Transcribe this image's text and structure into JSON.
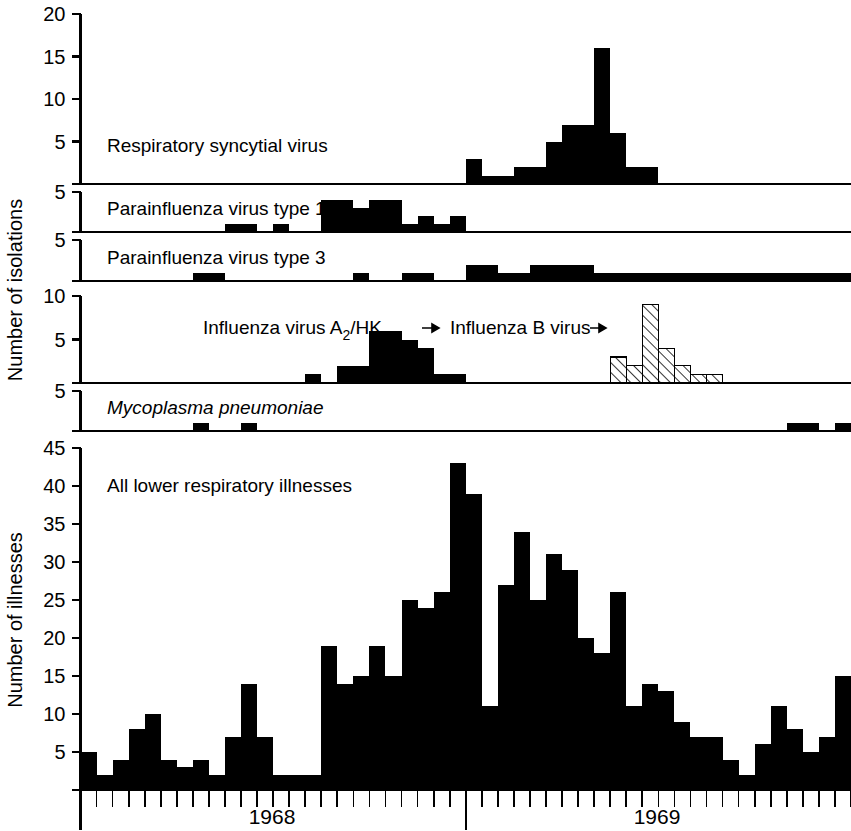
{
  "figure": {
    "axis_titles": {
      "isolations": "Number of isolations",
      "illnesses": "Number of illnesses"
    },
    "x_axis": {
      "year_labels": [
        "1968",
        "1969"
      ],
      "tick_count": 48,
      "major_tick_index": 24
    },
    "panels": [
      {
        "id": "rsv",
        "label": "Respiratory syncytial virus",
        "ymax": 20,
        "yticks": [
          5,
          10,
          15,
          20
        ]
      },
      {
        "id": "para1",
        "label": "Parainfluenza virus type 1",
        "ymax": 5,
        "yticks": [
          5
        ]
      },
      {
        "id": "para3",
        "label": "Parainfluenza virus type 3",
        "ymax": 5,
        "yticks": [
          5
        ]
      },
      {
        "id": "influenza",
        "label_a": "Influenza virus A",
        "label_a_sub": "2",
        "label_a_tail": "/HK",
        "label_b": "Influenza B virus",
        "ymax": 10,
        "yticks": [
          5,
          10
        ]
      },
      {
        "id": "mycoplasma",
        "label": "Mycoplasma pneumoniae",
        "ymax": 5,
        "yticks": [
          5
        ]
      },
      {
        "id": "illness",
        "label": "All lower respiratory illnesses",
        "ymax": 45,
        "yticks": [
          5,
          10,
          15,
          20,
          25,
          30,
          35,
          40,
          45
        ]
      }
    ],
    "colors": {
      "ink": "#000000",
      "background": "#ffffff",
      "hatch": "#000000"
    }
  },
  "chart_data": [
    {
      "type": "bar",
      "id": "rsv",
      "title": "Respiratory syncytial virus",
      "xlabel": "",
      "ylabel": "Number of isolations",
      "ylim": [
        0,
        20
      ],
      "grid": false,
      "categories": [
        1,
        2,
        3,
        4,
        5,
        6,
        7,
        8,
        9,
        10,
        11,
        12,
        13,
        14,
        15,
        16,
        17,
        18,
        19,
        20,
        21,
        22,
        23,
        24,
        25,
        26,
        27,
        28,
        29,
        30,
        31,
        32,
        33,
        34,
        35,
        36,
        37,
        38,
        39,
        40,
        41,
        42,
        43,
        44,
        45,
        46,
        47,
        48
      ],
      "values": [
        0,
        0,
        0,
        0,
        0,
        0,
        0,
        0,
        0,
        0,
        0,
        0,
        0,
        0,
        0,
        0,
        0,
        0,
        0,
        0,
        0,
        0,
        0,
        0,
        3,
        1,
        1,
        2,
        2,
        5,
        7,
        7,
        16,
        6,
        2,
        2,
        0,
        0,
        0,
        0,
        0,
        0,
        0,
        0,
        0,
        0,
        0,
        0
      ]
    },
    {
      "type": "bar",
      "id": "para1",
      "title": "Parainfluenza virus type 1",
      "xlabel": "",
      "ylabel": "Number of isolations",
      "ylim": [
        0,
        5
      ],
      "grid": false,
      "categories": [
        1,
        2,
        3,
        4,
        5,
        6,
        7,
        8,
        9,
        10,
        11,
        12,
        13,
        14,
        15,
        16,
        17,
        18,
        19,
        20,
        21,
        22,
        23,
        24,
        25,
        26,
        27,
        28,
        29,
        30,
        31,
        32,
        33,
        34,
        35,
        36,
        37,
        38,
        39,
        40,
        41,
        42,
        43,
        44,
        45,
        46,
        47,
        48
      ],
      "values": [
        0,
        0,
        0,
        0,
        0,
        0,
        0,
        0,
        0,
        1,
        1,
        0,
        1,
        0,
        0,
        4,
        4,
        3,
        4,
        4,
        1,
        2,
        1,
        2,
        0,
        0,
        0,
        0,
        0,
        0,
        0,
        0,
        0,
        0,
        0,
        0,
        0,
        0,
        0,
        0,
        0,
        0,
        0,
        0,
        0,
        0,
        0,
        0
      ]
    },
    {
      "type": "bar",
      "id": "para3",
      "title": "Parainfluenza virus type 3",
      "xlabel": "",
      "ylabel": "Number of isolations",
      "ylim": [
        0,
        5
      ],
      "grid": false,
      "categories": [
        1,
        2,
        3,
        4,
        5,
        6,
        7,
        8,
        9,
        10,
        11,
        12,
        13,
        14,
        15,
        16,
        17,
        18,
        19,
        20,
        21,
        22,
        23,
        24,
        25,
        26,
        27,
        28,
        29,
        30,
        31,
        32,
        33,
        34,
        35,
        36,
        37,
        38,
        39,
        40,
        41,
        42,
        43,
        44,
        45,
        46,
        47,
        48
      ],
      "values": [
        0,
        0,
        0,
        0,
        0,
        0,
        0,
        1,
        1,
        0,
        0,
        0,
        0,
        0,
        0,
        0,
        0,
        1,
        0,
        0,
        1,
        1,
        0,
        0,
        2,
        2,
        1,
        1,
        2,
        2,
        2,
        2,
        1,
        1,
        1,
        1,
        1,
        1,
        1,
        1,
        1,
        1,
        1,
        1,
        1,
        1,
        1,
        1
      ]
    },
    {
      "type": "bar",
      "id": "influenza_a2hk",
      "title": "Influenza virus A2/HK",
      "series_name": "Influenza virus A2/HK",
      "fill": "solid",
      "xlabel": "",
      "ylabel": "Number of isolations",
      "ylim": [
        0,
        10
      ],
      "grid": false,
      "categories": [
        1,
        2,
        3,
        4,
        5,
        6,
        7,
        8,
        9,
        10,
        11,
        12,
        13,
        14,
        15,
        16,
        17,
        18,
        19,
        20,
        21,
        22,
        23,
        24,
        25,
        26,
        27,
        28,
        29,
        30,
        31,
        32,
        33,
        34,
        35,
        36,
        37,
        38,
        39,
        40,
        41,
        42,
        43,
        44,
        45,
        46,
        47,
        48
      ],
      "values": [
        0,
        0,
        0,
        0,
        0,
        0,
        0,
        0,
        0,
        0,
        0,
        0,
        0,
        0,
        1,
        0,
        2,
        2,
        6,
        6,
        5,
        4,
        1,
        1,
        0,
        0,
        0,
        0,
        0,
        0,
        0,
        0,
        0,
        0,
        0,
        0,
        0,
        0,
        0,
        0,
        0,
        0,
        0,
        0,
        0,
        0,
        0,
        0
      ]
    },
    {
      "type": "bar",
      "id": "influenza_b",
      "title": "Influenza B virus",
      "series_name": "Influenza B virus",
      "fill": "hatched",
      "xlabel": "",
      "ylabel": "Number of isolations",
      "ylim": [
        0,
        10
      ],
      "grid": false,
      "categories": [
        1,
        2,
        3,
        4,
        5,
        6,
        7,
        8,
        9,
        10,
        11,
        12,
        13,
        14,
        15,
        16,
        17,
        18,
        19,
        20,
        21,
        22,
        23,
        24,
        25,
        26,
        27,
        28,
        29,
        30,
        31,
        32,
        33,
        34,
        35,
        36,
        37,
        38,
        39,
        40,
        41,
        42,
        43,
        44,
        45,
        46,
        47,
        48
      ],
      "values": [
        0,
        0,
        0,
        0,
        0,
        0,
        0,
        0,
        0,
        0,
        0,
        0,
        0,
        0,
        0,
        0,
        0,
        0,
        0,
        0,
        0,
        0,
        0,
        0,
        0,
        0,
        0,
        0,
        0,
        0,
        0,
        0,
        0,
        3,
        2,
        9,
        4,
        2,
        1,
        1,
        0,
        0,
        0,
        0,
        0,
        0,
        0,
        0
      ]
    },
    {
      "type": "bar",
      "id": "mycoplasma",
      "title": "Mycoplasma pneumoniae",
      "xlabel": "",
      "ylabel": "Number of isolations",
      "ylim": [
        0,
        5
      ],
      "grid": false,
      "categories": [
        1,
        2,
        3,
        4,
        5,
        6,
        7,
        8,
        9,
        10,
        11,
        12,
        13,
        14,
        15,
        16,
        17,
        18,
        19,
        20,
        21,
        22,
        23,
        24,
        25,
        26,
        27,
        28,
        29,
        30,
        31,
        32,
        33,
        34,
        35,
        36,
        37,
        38,
        39,
        40,
        41,
        42,
        43,
        44,
        45,
        46,
        47,
        48
      ],
      "values": [
        0,
        0,
        0,
        0,
        0,
        0,
        0,
        1,
        0,
        0,
        1,
        0,
        0,
        0,
        0,
        0,
        0,
        0,
        0,
        0,
        0,
        0,
        0,
        0,
        0,
        0,
        0,
        0,
        0,
        0,
        0,
        0,
        0,
        0,
        0,
        0,
        0,
        0,
        0,
        0,
        0,
        0,
        0,
        0,
        1,
        1,
        0,
        1
      ]
    },
    {
      "type": "bar",
      "id": "illness",
      "title": "All lower respiratory illnesses",
      "xlabel": "",
      "ylabel": "Number of illnesses",
      "ylim": [
        0,
        45
      ],
      "grid": false,
      "categories": [
        1,
        2,
        3,
        4,
        5,
        6,
        7,
        8,
        9,
        10,
        11,
        12,
        13,
        14,
        15,
        16,
        17,
        18,
        19,
        20,
        21,
        22,
        23,
        24,
        25,
        26,
        27,
        28,
        29,
        30,
        31,
        32,
        33,
        34,
        35,
        36,
        37,
        38,
        39,
        40,
        41,
        42,
        43,
        44,
        45,
        46,
        47,
        48
      ],
      "values": [
        5,
        2,
        4,
        8,
        10,
        4,
        3,
        4,
        2,
        7,
        14,
        7,
        2,
        2,
        2,
        19,
        14,
        15,
        19,
        15,
        25,
        24,
        26,
        43,
        39,
        11,
        27,
        34,
        25,
        31,
        29,
        20,
        18,
        26,
        11,
        14,
        13,
        9,
        7,
        7,
        4,
        2,
        6,
        11,
        8,
        5,
        7,
        15
      ]
    }
  ]
}
